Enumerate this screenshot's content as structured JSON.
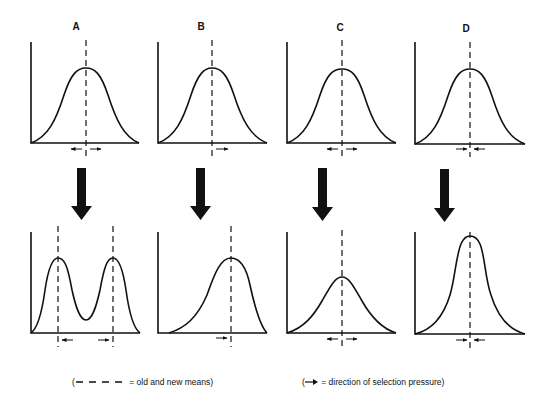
{
  "figure": {
    "panels": [
      {
        "label": "A",
        "type": "disruptive",
        "before": "unimodal",
        "after": "bimodal",
        "pressure": "outward from mean (both directions)"
      },
      {
        "label": "B",
        "type": "directional",
        "before": "unimodal",
        "after": "shifted/skewed right",
        "pressure": "rightward"
      },
      {
        "label": "C",
        "type": "diversifying (flattening)",
        "before": "unimodal",
        "after": "broader, lower peak",
        "pressure": "outward from mean"
      },
      {
        "label": "D",
        "type": "stabilizing",
        "before": "unimodal",
        "after": "narrower, taller peak",
        "pressure": "inward toward mean"
      }
    ],
    "transition_arrow": "down-arrow",
    "colors": {
      "ink": "#111111",
      "background": "#ffffff"
    }
  },
  "legend": {
    "means": {
      "symbol": "dashed-line",
      "text": "= old and new means)"
    },
    "pressure": {
      "symbol": "arrow-right",
      "text": "= direction of selection pressure)"
    },
    "open_paren": "("
  }
}
